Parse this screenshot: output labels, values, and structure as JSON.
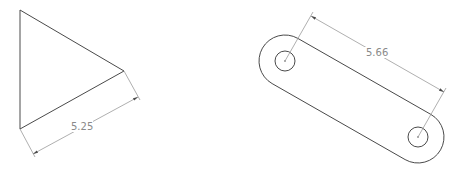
{
  "drawings": {
    "triangle": {
      "name": "triangle",
      "vertices": [
        [
          20,
          10
        ],
        [
          20,
          129
        ],
        [
          124,
          71
        ]
      ],
      "dimension": {
        "label": "5.25",
        "ext1": [
          [
            20,
            129
          ],
          [
            35,
            157
          ]
        ],
        "ext2": [
          [
            124,
            71
          ],
          [
            140,
            100
          ]
        ],
        "line": [
          [
            33,
            154
          ],
          [
            138,
            97
          ]
        ],
        "text_pos": [
          71,
          130
        ],
        "angle": -28.8
      }
    },
    "slot": {
      "name": "slot",
      "center1": [
        285,
        61
      ],
      "center2": [
        418,
        137
      ],
      "inner_radius": 10,
      "outer_radius": 26,
      "dimension": {
        "label": "5.66",
        "ext1": [
          [
            285,
            61
          ],
          [
            313,
            12
          ]
        ],
        "ext2": [
          [
            418,
            137
          ],
          [
            446,
            88
          ]
        ],
        "line": [
          [
            311,
            16
          ],
          [
            444,
            92
          ]
        ],
        "text_pos": [
          366,
          56
        ],
        "angle": 29.7
      }
    }
  },
  "colors": {
    "geometry": "#4a4a4a",
    "dimension": "#9a9a9a",
    "text": "#8a8a8a",
    "background": "#ffffff"
  }
}
